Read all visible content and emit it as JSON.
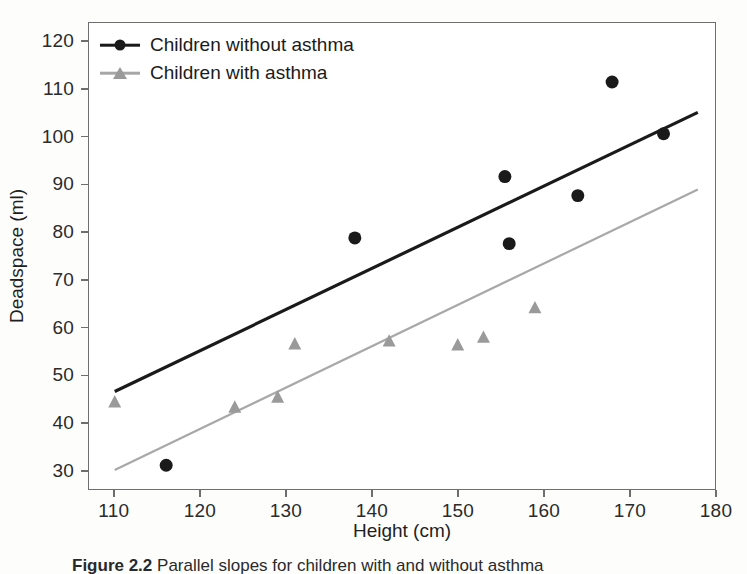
{
  "chart_data": {
    "type": "scatter",
    "title": "",
    "xlabel": "Height (cm)",
    "ylabel": "Deadspace (ml)",
    "xlim": [
      107,
      180
    ],
    "ylim": [
      26,
      124
    ],
    "xticks": [
      110,
      120,
      130,
      140,
      150,
      160,
      170,
      180
    ],
    "yticks": [
      30,
      40,
      50,
      60,
      70,
      80,
      90,
      100,
      110,
      120
    ],
    "grid": false,
    "legend_position": "top-left",
    "series": [
      {
        "name": "Children without asthma",
        "marker": "circle",
        "color": "#1a1a1a",
        "points": [
          {
            "x": 116,
            "y": 31
          },
          {
            "x": 138,
            "y": 78.8
          },
          {
            "x": 155.5,
            "y": 91.7
          },
          {
            "x": 156,
            "y": 77.6
          },
          {
            "x": 164,
            "y": 87.7
          },
          {
            "x": 168,
            "y": 111.6
          },
          {
            "x": 174,
            "y": 100.7
          }
        ],
        "fit_line": {
          "x0": 110,
          "y0": 46.5,
          "x1": 178,
          "y1": 105.2
        }
      },
      {
        "name": "Children with asthma",
        "marker": "triangle",
        "color": "#9a9a9a",
        "points": [
          {
            "x": 110,
            "y": 44.2
          },
          {
            "x": 124,
            "y": 43.1
          },
          {
            "x": 129,
            "y": 45.2
          },
          {
            "x": 131,
            "y": 56.4
          },
          {
            "x": 142,
            "y": 57.0
          },
          {
            "x": 150,
            "y": 56.2
          },
          {
            "x": 153,
            "y": 57.8
          },
          {
            "x": 159,
            "y": 64.0
          }
        ],
        "fit_line": {
          "x0": 110,
          "y0": 30.0,
          "x1": 178,
          "y1": 89.0
        }
      }
    ]
  },
  "legend": {
    "items": [
      {
        "label": "Children without asthma",
        "color": "#1a1a1a",
        "marker": "circle"
      },
      {
        "label": "Children with asthma",
        "color": "#9a9a9a",
        "marker": "triangle"
      }
    ]
  },
  "caption": {
    "figure_number": "Figure 2.2",
    "text": "Parallel slopes for children with and without asthma"
  }
}
